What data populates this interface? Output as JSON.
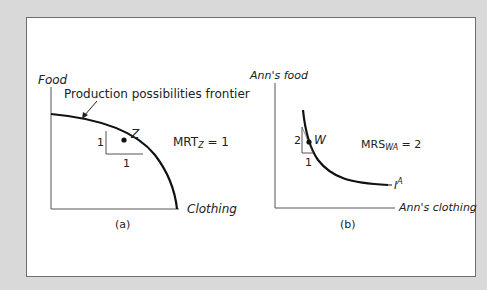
{
  "figure": {
    "panel_a": {
      "y_axis_label": "Food",
      "x_axis_label": "Clothing",
      "curve_label": "Production possibilities frontier",
      "point_label": "Z",
      "rise_label": "1",
      "run_label": "1",
      "rate_main": "MRT",
      "rate_sub": "Z",
      "rate_value": " = 1",
      "caption": "(a)"
    },
    "panel_b": {
      "y_axis_label": "Ann's food",
      "x_axis_label": "Ann's clothing",
      "curve_label_main": "I",
      "curve_label_sup": "A",
      "point_label": "W",
      "rise_label": "2",
      "run_label": "1",
      "rate_main": "MRS",
      "rate_sub": "WA",
      "rate_value": " = 2",
      "caption": "(b)"
    }
  },
  "colors": {
    "frame": "#d9d9d9",
    "panel": "#ffffff",
    "axis": "#555555",
    "curve": "#111111"
  }
}
